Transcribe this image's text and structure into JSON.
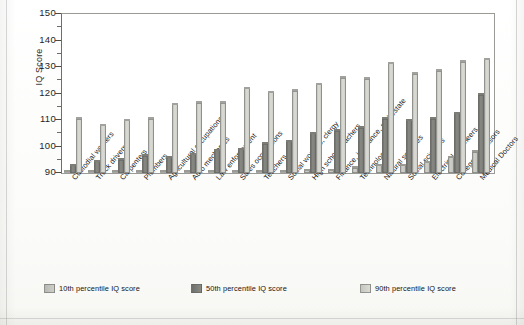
{
  "chart_data": {
    "type": "bar",
    "title": "",
    "subtitle": "",
    "xlabel": "",
    "ylabel": "IQ Score",
    "ylim": [
      90,
      150
    ],
    "ytick_labels": [
      "150",
      "140",
      "130",
      "120",
      "110",
      "100",
      "90"
    ],
    "ytick_values": [
      150,
      140,
      130,
      120,
      110,
      100,
      90
    ],
    "minor_tick_step": 5,
    "grid": false,
    "legend_position": "bottom",
    "categories": [
      "Custodial workers",
      "Truck drivers",
      "Carpenters",
      "Plumbers",
      "Agricultural occupations",
      "Auto mechanics",
      "Law enforcement",
      "Sales occupations",
      "Teachers, K-5",
      "Social workers, clergy",
      "High school teachers",
      "Finance, insurance, real estate",
      "Technology",
      "Natural sciences",
      "Social sciences",
      "Electrical engineers",
      "College professors",
      "Medical Doctors"
    ],
    "series": [
      {
        "name": "10th percentile IQ score",
        "color": "#c4c4bf",
        "values": [
          90,
          90,
          90,
          90,
          90,
          90,
          90,
          90,
          90,
          90,
          91,
          91,
          92,
          93,
          93,
          94,
          96,
          98
        ]
      },
      {
        "name": "50th percentile IQ score",
        "color": "#7a7a76",
        "values": [
          93,
          94.5,
          95,
          96.5,
          96,
          97,
          98.5,
          99,
          101,
          102,
          105,
          106,
          107,
          110.5,
          110,
          110.5,
          112.5,
          119.5
        ]
      },
      {
        "name": "90th percentile IQ score",
        "color": "#cfcfca",
        "values": [
          110.5,
          108,
          110,
          110.5,
          116,
          116.5,
          116.5,
          122,
          120.5,
          121,
          123.5,
          126,
          125.5,
          131.5,
          127.5,
          128.5,
          132,
          133
        ]
      }
    ]
  },
  "legend": {
    "items": [
      {
        "label": "10th percentile IQ score",
        "swatch": "s10"
      },
      {
        "label": "50th percentile IQ score",
        "swatch": "s50"
      },
      {
        "label": "90th percentile IQ score",
        "swatch": "s90"
      }
    ]
  },
  "axes": {
    "y_title": "IQ Score"
  }
}
